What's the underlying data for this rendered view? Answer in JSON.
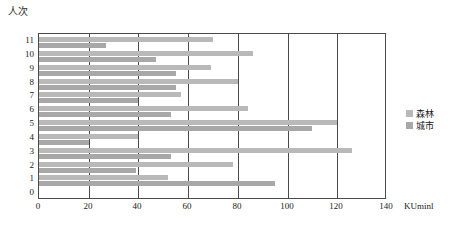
{
  "chart_data": {
    "type": "bar",
    "orientation": "horizontal",
    "title": "",
    "subtitle": "",
    "xlabel": "KUminl",
    "ylabel": "人次",
    "xlim": [
      0,
      140
    ],
    "ylim": [
      0,
      11
    ],
    "grid": true,
    "x_ticks": [
      0,
      20,
      40,
      60,
      80,
      100,
      120,
      140
    ],
    "y_ticks": [
      0,
      1,
      2,
      3,
      4,
      5,
      6,
      7,
      8,
      9,
      10,
      11
    ],
    "categories": [
      "1",
      "2",
      "3",
      "4",
      "5",
      "6",
      "7",
      "8",
      "9",
      "10",
      "11"
    ],
    "legend_position": "right",
    "series": [
      {
        "name": "森林",
        "color": "#b9b9b9",
        "values": [
          52,
          78,
          126,
          40,
          120,
          84,
          57,
          80,
          69,
          86,
          70
        ]
      },
      {
        "name": "城市",
        "color": "#a8a8a8",
        "values": [
          95,
          39,
          53,
          20,
          110,
          53,
          40,
          55,
          55,
          47,
          27
        ]
      }
    ]
  },
  "axis": {
    "y_unit_label": "人次",
    "x_unit_label": "KUminl",
    "x_tick_labels": [
      "0",
      "20",
      "40",
      "60",
      "80",
      "100",
      "120",
      "140"
    ],
    "y_tick_labels": [
      "11",
      "10",
      "9",
      "8",
      "7",
      "6",
      "5",
      "4",
      "3",
      "2",
      "1",
      "0"
    ]
  },
  "legend": {
    "items": [
      {
        "label": "森林",
        "color": "#b9b9b9"
      },
      {
        "label": "城市",
        "color": "#a8a8a8"
      }
    ]
  },
  "colors": {
    "forest": "#b9b9b9",
    "city": "#a8a8a8",
    "axis": "#4a4a4a",
    "background": "#ffffff"
  }
}
